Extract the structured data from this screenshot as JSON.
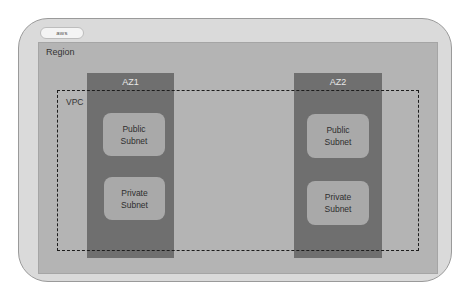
{
  "diagram": {
    "logo": {
      "text": "aws",
      "icon": "aws-cloud-icon"
    },
    "region": {
      "label": "Region"
    },
    "vpc": {
      "label": "VPC",
      "border_style": "dashed"
    },
    "availability_zones": [
      {
        "label": "AZ1",
        "subnets": [
          {
            "label": "Public\nSubnet",
            "type": "public"
          },
          {
            "label": "Private\nSubnet",
            "type": "private"
          }
        ]
      },
      {
        "label": "AZ2",
        "subnets": [
          {
            "label": "Public\nSubnet",
            "type": "public"
          },
          {
            "label": "Private\nSubnet",
            "type": "private"
          }
        ]
      }
    ],
    "colors": {
      "outer": "#dadada",
      "region": "#b4b4b4",
      "az": "#6f6f6f",
      "subnet": "#a9a9a9",
      "vpc_border": "#1c1c1c"
    }
  }
}
